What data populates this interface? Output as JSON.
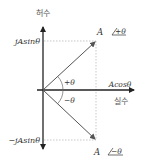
{
  "diagram": {
    "axes": {
      "imaginary_label": "허수",
      "real_label": "실수"
    },
    "labels": {
      "pos_phasor": "A",
      "pos_angle": "+θ",
      "neg_phasor": "A",
      "neg_angle": "−θ",
      "pos_imag_projection": "jAsinθ",
      "neg_imag_projection": "−jAsinθ",
      "real_projection": "Acosθ",
      "arc_pos": "+θ",
      "arc_neg": "−θ"
    },
    "colors": {
      "axis": "#222222",
      "phasor": "#555555",
      "dotted": "#aaaaaa",
      "text": "#333333"
    }
  }
}
